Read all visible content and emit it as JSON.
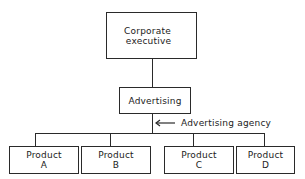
{
  "diagram": {
    "type": "organization-chart",
    "nodes": {
      "top": {
        "line1": "Corporate",
        "line2": "executive"
      },
      "middle": {
        "label": "Advertising"
      },
      "products": [
        {
          "line1": "Product",
          "line2": "A"
        },
        {
          "line1": "Product",
          "line2": "B"
        },
        {
          "line1": "Product",
          "line2": "C"
        },
        {
          "line1": "Product",
          "line2": "D"
        }
      ]
    },
    "annotation": {
      "label": "Advertising agency",
      "arrow": "left-arrow"
    },
    "colors": {
      "line": "#2a2a2a",
      "background": "#ffffff"
    }
  }
}
